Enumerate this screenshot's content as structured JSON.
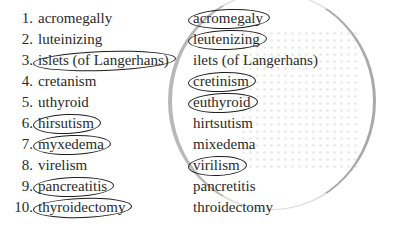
{
  "exercise": {
    "left_column": [
      {
        "number": "1.",
        "word": "acromegally",
        "circled": false
      },
      {
        "number": "2.",
        "word": "luteinizing",
        "circled": false
      },
      {
        "number": "3.",
        "word": "islets (of Langerhans)",
        "circled": true
      },
      {
        "number": "4.",
        "word": "cretanism",
        "circled": false
      },
      {
        "number": "5.",
        "word": "uthyroid",
        "circled": false
      },
      {
        "number": "6.",
        "word": "hirsutism",
        "circled": true
      },
      {
        "number": "7.",
        "word": "myxedema",
        "circled": true
      },
      {
        "number": "8.",
        "word": "virelism",
        "circled": false
      },
      {
        "number": "9.",
        "word": "pancreatitis",
        "circled": true
      },
      {
        "number": "10.",
        "word": "thyroidectomy",
        "circled": true
      }
    ],
    "right_column": [
      {
        "word": "acromegaly",
        "circled": true
      },
      {
        "word": "leutenizing",
        "circled": true
      },
      {
        "word": "ilets (of Langerhans)",
        "circled": false
      },
      {
        "word": "cretinism",
        "circled": true
      },
      {
        "word": "euthyroid",
        "circled": true
      },
      {
        "word": "hirtsutism",
        "circled": false
      },
      {
        "word": "mixedema",
        "circled": false
      },
      {
        "word": "virilism",
        "circled": true
      },
      {
        "word": "pancretitis",
        "circled": false
      },
      {
        "word": "throidectomy",
        "circled": false
      }
    ]
  }
}
